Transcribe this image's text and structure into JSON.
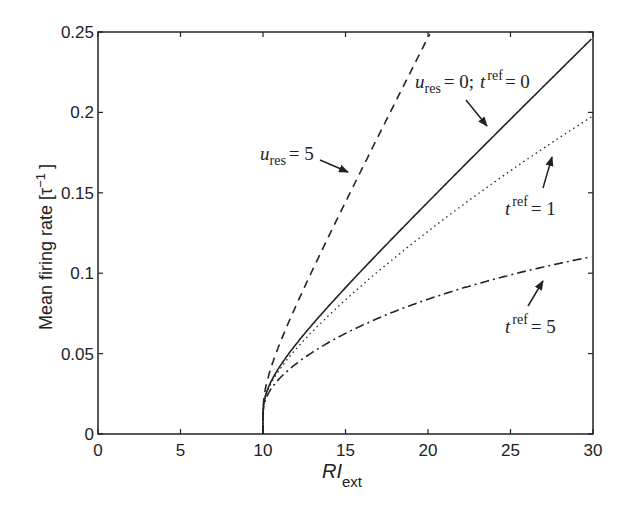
{
  "chart_data": {
    "type": "line",
    "title": "",
    "xlabel": "RI_ext",
    "xlabel_main": "RI",
    "xlabel_sub": "ext",
    "ylabel": "Mean firing rate  [τ⁻¹]",
    "xlim": [
      0,
      30
    ],
    "ylim": [
      0,
      0.25
    ],
    "grid": false,
    "legend": "none (inline annotations with arrows)",
    "x_ticks": [
      "0",
      "5",
      "10",
      "15",
      "20",
      "25",
      "30"
    ],
    "y_ticks": [
      "0",
      "0.05",
      "0.1",
      "0.15",
      "0.2",
      "0.25"
    ],
    "x": [
      10,
      10.05,
      10.2,
      10.5,
      11,
      12,
      13,
      14,
      15,
      16,
      17,
      18,
      19,
      20,
      22,
      24,
      26,
      28,
      30
    ],
    "series": [
      {
        "name": "u_res = 0; t_ref = 0",
        "style": "solid",
        "values": [
          0,
          0.0192,
          0.0254,
          0.0328,
          0.0417,
          0.0558,
          0.0682,
          0.0798,
          0.091,
          0.1019,
          0.1127,
          0.1234,
          0.134,
          0.1443,
          0.1651,
          0.1857,
          0.2062,
          0.2266,
          0.2466
        ]
      },
      {
        "name": "t_ref = 1",
        "style": "dotted",
        "values": [
          0,
          0.0182,
          0.0236,
          0.03,
          0.0374,
          0.0486,
          0.058,
          0.0664,
          0.0741,
          0.0813,
          0.088,
          0.0945,
          0.1006,
          0.1062,
          0.1172,
          0.1274,
          0.137,
          0.1461,
          0.1975
        ]
      },
      {
        "name": "t_ref = 5",
        "style": "dashdot",
        "values": [
          0,
          0.0153,
          0.0187,
          0.0222,
          0.0258,
          0.0305,
          0.0339,
          0.0365,
          0.0387,
          0.0406,
          0.0423,
          0.0438,
          0.0451,
          0.0463,
          0.0484,
          0.0502,
          0.0518,
          0.0531,
          0.1102
        ]
      },
      {
        "name": "u_res = 5",
        "style": "dashed",
        "x": [
          10,
          10.05,
          10.2,
          10.5,
          11,
          12,
          13,
          14,
          15,
          16,
          17,
          18,
          19,
          20.1
        ],
        "values": [
          0,
          0.0197,
          0.0267,
          0.0352,
          0.0461,
          0.0648,
          0.0823,
          0.0993,
          0.116,
          0.1325,
          0.149,
          0.1654,
          0.1816,
          0.25
        ]
      }
    ],
    "annotations": [
      {
        "text": "u_res = 0;  t_ref = 0",
        "points_to": "solid"
      },
      {
        "text": "u_res = 5",
        "points_to": "dashed"
      },
      {
        "text": "t_ref = 1",
        "points_to": "dotted"
      },
      {
        "text": "t_ref = 5",
        "points_to": "dashdot"
      }
    ]
  },
  "labels": {
    "ylabel": "Mean firing rate  [τ",
    "ylabel_sup": "−1",
    "ylabel_close": "]",
    "xlabel_main": "RI",
    "xlabel_sub": "ext",
    "annot_solid_u": "u",
    "annot_solid_res": "res",
    "annot_solid_eq": "= 0;",
    "annot_solid_t": "t",
    "annot_solid_ref": "ref",
    "annot_solid_eq2": "= 0",
    "annot_dashed_u": "u",
    "annot_dashed_res": "res",
    "annot_dashed_eq": "= 5",
    "annot_dotted_t": "t",
    "annot_dotted_ref": "ref",
    "annot_dotted_eq": "= 1",
    "annot_dashdot_t": "t",
    "annot_dashdot_ref": "ref",
    "annot_dashdot_eq": "= 5"
  },
  "colors": {
    "line": "#222222",
    "axis": "#222222",
    "background": "#ffffff"
  }
}
